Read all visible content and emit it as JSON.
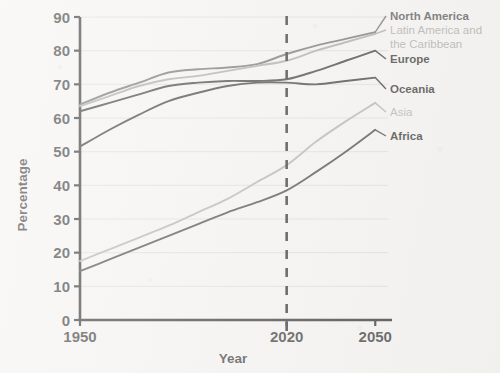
{
  "chart_data": {
    "type": "line",
    "title": "",
    "xlabel": "Year",
    "ylabel": "Percentage",
    "xlim": [
      1950,
      2055
    ],
    "ylim": [
      0,
      90
    ],
    "xticks": [
      "1950",
      "2020",
      "2050"
    ],
    "xtick_values": [
      1950,
      2020,
      2050
    ],
    "yticks": [
      "0",
      "10",
      "20",
      "30",
      "40",
      "50",
      "60",
      "70",
      "80",
      "90"
    ],
    "ytick_values": [
      0,
      10,
      20,
      30,
      40,
      50,
      60,
      70,
      80,
      90
    ],
    "grid": true,
    "legend_position": "right-inline",
    "annotations": [
      {
        "name": "projection-divider",
        "type": "vertical-dashed-line",
        "x": 2020
      }
    ],
    "x": [
      1950,
      1960,
      1970,
      1980,
      1990,
      2000,
      2010,
      2020,
      2030,
      2040,
      2050
    ],
    "series": [
      {
        "name": "North America",
        "color": "#5a5a5a",
        "values": [
          64,
          67.5,
          70.5,
          73.5,
          74.5,
          75,
          76,
          79,
          81.5,
          83.5,
          85.5
        ]
      },
      {
        "name": "Latin America and the Caribbean",
        "color": "#9a9a9a",
        "values": [
          63.5,
          66.5,
          69.5,
          71.5,
          72.5,
          74,
          75.5,
          77,
          80,
          82.5,
          85
        ]
      },
      {
        "name": "Europe",
        "color": "#1b1b1b",
        "values": [
          62,
          64.5,
          67,
          69.5,
          70.5,
          71,
          71,
          71.5,
          74,
          77,
          80
        ]
      },
      {
        "name": "Oceania",
        "color": "#1b1b1b",
        "values": [
          51.5,
          56.5,
          61,
          65,
          67.5,
          69.5,
          70.5,
          70.5,
          70,
          71,
          72
        ]
      },
      {
        "name": "Asia",
        "color": "#a5a5a5",
        "values": [
          17.5,
          21,
          24.5,
          28,
          32,
          36,
          41,
          46,
          53,
          59,
          64.5
        ]
      },
      {
        "name": "Africa",
        "color": "#2a2a2a",
        "values": [
          14.5,
          18,
          21.5,
          25,
          28.5,
          32,
          35,
          38.5,
          44,
          50,
          56.5
        ]
      }
    ]
  },
  "labels": {
    "north_america": "North America",
    "latin_america_line1": "Latin America and",
    "latin_america_line2": "the Caribbean",
    "europe": "Europe",
    "oceania": "Oceania",
    "asia": "Asia",
    "africa": "Africa"
  },
  "axes": {
    "x_title": "Year",
    "y_title": "Percentage"
  },
  "colors": {
    "north_america": "#5a5a5a",
    "latin_america": "#9a9a9a",
    "europe": "#1b1b1b",
    "oceania": "#1b1b1b",
    "asia": "#a5a5a5",
    "africa": "#2a2a2a",
    "axis": "#111111",
    "grid": "#d4d4d4",
    "background": "#f3f2f0"
  }
}
